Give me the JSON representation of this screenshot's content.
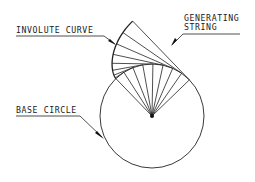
{
  "diagram": {
    "colors": {
      "line": "#222222",
      "background": "#ffffff"
    },
    "base_circle": {
      "center": [
        152,
        116
      ],
      "radius": 52
    },
    "involute": {
      "start_angle_deg": 226,
      "end_angle_deg": 316,
      "spoke_count": 9
    },
    "labels": {
      "involute_curve": "INVOLUTE CURVE",
      "generating_string_line1": "GENERATING",
      "generating_string_line2": "STRING",
      "base_circle": "BASE CIRCLE"
    }
  }
}
